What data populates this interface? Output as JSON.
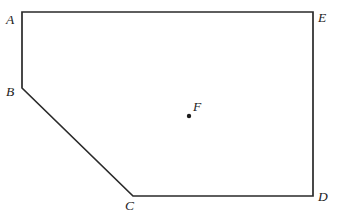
{
  "figure": {
    "kind": "geometry-diagram",
    "background_color": "#ffffff",
    "stroke_color": "#2a2a2a",
    "stroke_width": 1.7,
    "label_color": "#1c1c1c",
    "width": 337,
    "height": 215,
    "polygon": {
      "name": "pentagon-abcde",
      "closed": true,
      "path_points": "22,12 313,12 313,196 133,196 22,88",
      "vertices": [
        {
          "id": "A",
          "label": "A",
          "x": 22,
          "y": 12,
          "label_x": 6,
          "label_y": 13
        },
        {
          "id": "E",
          "label": "E",
          "x": 313,
          "y": 12,
          "label_x": 318,
          "label_y": 11
        },
        {
          "id": "D",
          "label": "D",
          "x": 313,
          "y": 196,
          "label_x": 318,
          "label_y": 190
        },
        {
          "id": "C",
          "label": "C",
          "x": 133,
          "y": 196,
          "label_x": 125,
          "label_y": 199
        },
        {
          "id": "B",
          "label": "B",
          "x": 22,
          "y": 88,
          "label_x": 6,
          "label_y": 85
        }
      ],
      "edges": [
        {
          "id": "AE",
          "from": "A",
          "to": "E"
        },
        {
          "id": "ED",
          "from": "E",
          "to": "D"
        },
        {
          "id": "DC",
          "from": "D",
          "to": "C"
        },
        {
          "id": "CB",
          "from": "C",
          "to": "B"
        },
        {
          "id": "BA",
          "from": "B",
          "to": "A"
        }
      ]
    },
    "interior_points": [
      {
        "id": "F",
        "label": "F",
        "x": 189,
        "y": 116,
        "dot_radius": 2.2,
        "label_x": 193,
        "label_y": 100
      }
    ]
  }
}
